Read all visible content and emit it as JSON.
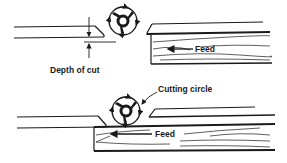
{
  "diagram": {
    "type": "jointer-cutterhead-illustration",
    "colors": {
      "ink": "#1a1a1a",
      "background": "#ffffff"
    },
    "panels": [
      {
        "id": "top",
        "labels": {
          "depth": "Depth of cut",
          "feed": "Feed"
        },
        "parts": [
          "infeed-table",
          "cutterhead",
          "outfeed-table",
          "workpiece",
          "feed-arrow",
          "depth-of-cut-dimension"
        ]
      },
      {
        "id": "bottom",
        "labels": {
          "cutting_circle": "Cutting circle",
          "feed": "Feed"
        },
        "parts": [
          "infeed-table",
          "cutterhead",
          "outfeed-table",
          "workpiece",
          "feed-arrow",
          "cutting-circle-leader"
        ]
      }
    ]
  }
}
